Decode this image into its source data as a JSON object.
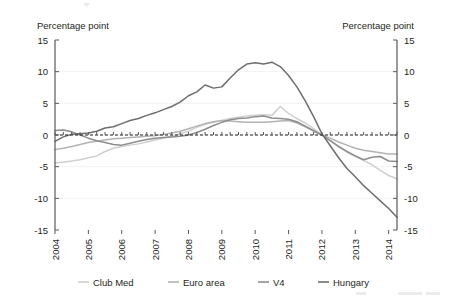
{
  "chart_data": {
    "type": "line",
    "title": "",
    "subtitle": "",
    "xlabel": "",
    "ylabel_left": "Percentage point",
    "ylabel_right": "Percentage point",
    "ylim": [
      -15,
      15
    ],
    "xlim": [
      2004,
      2014.25
    ],
    "yticks": [
      15,
      10,
      5,
      0,
      -5,
      -10,
      -15
    ],
    "ytick_labels_left": [
      "15",
      "10",
      "5",
      "0",
      "-5",
      "-10",
      "-15"
    ],
    "ytick_labels_right": [
      "15",
      "10",
      "5",
      "0",
      "-5",
      "-10",
      "-15"
    ],
    "xticks": [
      2004,
      2005,
      2006,
      2007,
      2008,
      2009,
      2010,
      2011,
      2012,
      2013,
      2014
    ],
    "xtick_labels": [
      "2004",
      "2005",
      "2006",
      "2007",
      "2008",
      "2009",
      "2010",
      "2011",
      "2012",
      "2013",
      "2014"
    ],
    "grid": true,
    "grid_axis": "y",
    "legend_position": "bottom",
    "zero_reference_line": true,
    "x": [
      2004.0,
      2004.25,
      2004.5,
      2004.75,
      2005.0,
      2005.25,
      2005.5,
      2005.75,
      2006.0,
      2006.25,
      2006.5,
      2006.75,
      2007.0,
      2007.25,
      2007.5,
      2007.75,
      2008.0,
      2008.25,
      2008.5,
      2008.75,
      2009.0,
      2009.25,
      2009.5,
      2009.75,
      2010.0,
      2010.25,
      2010.5,
      2010.75,
      2011.0,
      2011.25,
      2011.5,
      2011.75,
      2012.0,
      2012.25,
      2012.5,
      2012.75,
      2013.0,
      2013.25,
      2013.5,
      2013.75,
      2014.0,
      2014.25
    ],
    "series": [
      {
        "name": "Club Med",
        "color": "#cfcfcf",
        "values": [
          -4.4,
          -4.3,
          -4.1,
          -3.9,
          -3.6,
          -3.3,
          -2.6,
          -2.1,
          -1.8,
          -1.6,
          -1.4,
          -1.1,
          -0.8,
          -0.5,
          -0.2,
          0.2,
          0.6,
          1.2,
          1.7,
          2.0,
          2.3,
          2.6,
          2.8,
          3.0,
          3.1,
          3.2,
          3.1,
          4.5,
          3.4,
          2.6,
          1.9,
          1.0,
          0.0,
          -0.9,
          -1.9,
          -2.7,
          -3.4,
          -4.0,
          -4.7,
          -5.6,
          -6.4,
          -6.9
        ]
      },
      {
        "name": "Euro area",
        "color": "#b3b3b3",
        "values": [
          -2.3,
          -2.1,
          -1.8,
          -1.5,
          -1.2,
          -1.0,
          -0.8,
          -0.6,
          -0.5,
          -0.4,
          -0.3,
          -0.2,
          -0.1,
          0.1,
          0.3,
          0.6,
          1.0,
          1.4,
          1.8,
          2.1,
          2.3,
          2.2,
          2.1,
          2.0,
          2.0,
          2.0,
          2.1,
          2.2,
          2.3,
          1.9,
          1.3,
          0.6,
          0.0,
          -0.5,
          -1.1,
          -1.6,
          -2.1,
          -2.4,
          -2.6,
          -2.8,
          -3.0,
          -3.0
        ]
      },
      {
        "name": "V4",
        "color": "#8d8d8d",
        "values": [
          0.7,
          0.8,
          0.5,
          0.0,
          -0.5,
          -0.9,
          -1.2,
          -1.5,
          -1.6,
          -1.3,
          -1.0,
          -0.7,
          -0.5,
          -0.4,
          -0.3,
          -0.2,
          0.0,
          0.4,
          0.9,
          1.5,
          2.0,
          2.4,
          2.6,
          2.7,
          2.9,
          3.0,
          2.7,
          2.6,
          2.5,
          2.1,
          1.4,
          0.7,
          0.0,
          -0.9,
          -1.8,
          -2.6,
          -3.3,
          -3.9,
          -3.5,
          -3.4,
          -4.1,
          -4.2
        ]
      },
      {
        "name": "Hungary",
        "color": "#6d6e70",
        "values": [
          -1.0,
          -0.3,
          0.1,
          0.2,
          0.3,
          0.6,
          1.1,
          1.3,
          1.8,
          2.3,
          2.6,
          3.1,
          3.5,
          4.0,
          4.5,
          5.2,
          6.2,
          6.8,
          7.9,
          7.4,
          7.6,
          9.0,
          10.3,
          11.2,
          11.4,
          11.2,
          11.5,
          10.8,
          9.4,
          7.6,
          5.4,
          2.9,
          0.2,
          -1.7,
          -3.6,
          -5.3,
          -6.6,
          -8.0,
          -9.2,
          -10.4,
          -11.6,
          -13.0
        ]
      }
    ]
  },
  "legend": {
    "items": [
      {
        "label": "Club Med",
        "color": "#cfcfcf"
      },
      {
        "label": "Euro area",
        "color": "#b3b3b3"
      },
      {
        "label": "V4",
        "color": "#8d8d8d"
      },
      {
        "label": "Hungary",
        "color": "#6d6e70"
      }
    ]
  }
}
